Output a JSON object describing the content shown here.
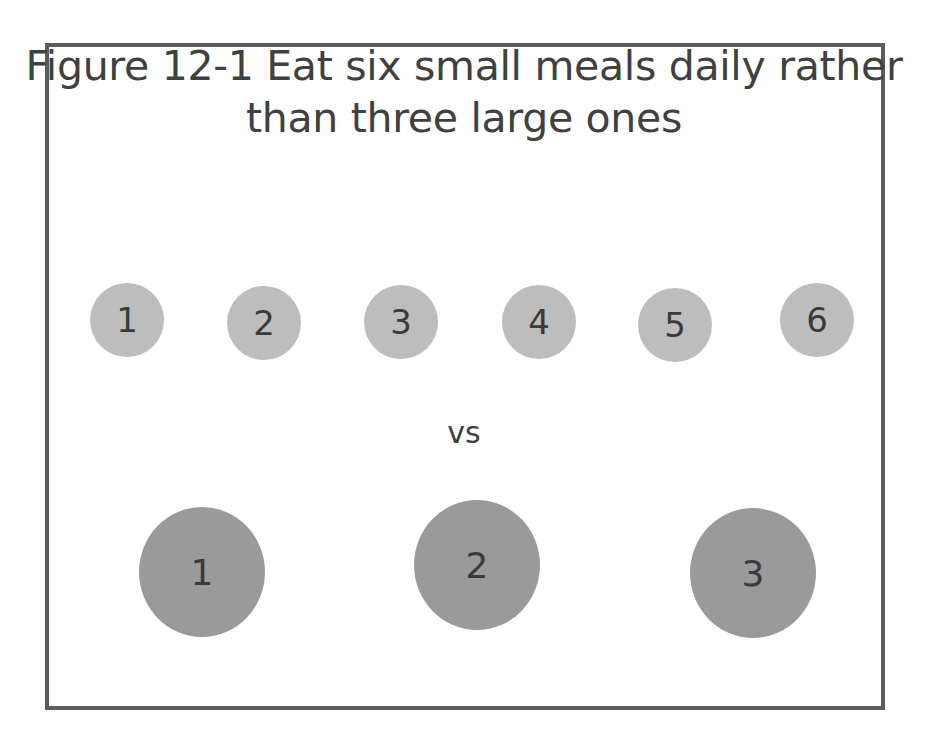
{
  "figure": {
    "title_line1": "Figure 12-1 Eat six small meals daily rather",
    "title_line2": "than three large ones",
    "separator_label": "vs",
    "colors": {
      "border": "#5c5c5c",
      "small_circle": "#bdbdbd",
      "large_circle": "#9a9a9a",
      "text": "#3a3a3a"
    },
    "small_meals": [
      {
        "label": "1"
      },
      {
        "label": "2"
      },
      {
        "label": "3"
      },
      {
        "label": "4"
      },
      {
        "label": "5"
      },
      {
        "label": "6"
      }
    ],
    "large_meals": [
      {
        "label": "1"
      },
      {
        "label": "2"
      },
      {
        "label": "3"
      }
    ]
  }
}
